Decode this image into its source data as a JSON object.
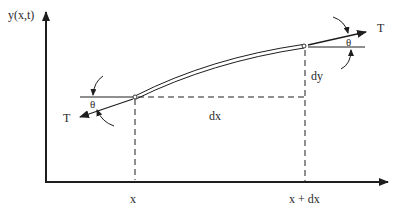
{
  "diagram": {
    "colors": {
      "stroke": "#1e1e1e",
      "text": "#2a2a2a",
      "background": "#ffffff"
    },
    "axes": {
      "y_label": "y(x,t)",
      "x_tick_left": "x",
      "x_tick_right": "x + dx"
    },
    "labels": {
      "left_tension": "T",
      "right_tension": "T",
      "left_angle": "θ",
      "right_angle": "θ",
      "dx": "dx",
      "dy": "dy"
    },
    "points": {
      "left": {
        "x": 135,
        "y": 97
      },
      "right": {
        "x": 303,
        "y": 46
      }
    }
  }
}
